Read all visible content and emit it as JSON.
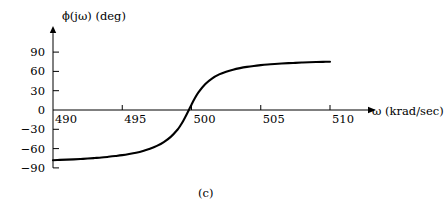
{
  "figure": {
    "caption": "(c)",
    "background_color": "#ffffff",
    "line_color": "#000000"
  },
  "chart_data": {
    "type": "line",
    "title": "",
    "subtitle": "",
    "xlabel": "ω (krad/sec)",
    "ylabel": "ϕ(jω) (deg)",
    "xlim": [
      490,
      510
    ],
    "ylim": [
      -90,
      90
    ],
    "xticks": [
      490,
      495,
      500,
      505,
      510
    ],
    "xtick_labels": [
      "490",
      "495",
      "500",
      "505",
      "510"
    ],
    "yticks": [
      -90,
      -60,
      -30,
      0,
      30,
      60,
      90
    ],
    "ytick_labels": [
      "−90",
      "−60",
      "−30",
      "0",
      "30",
      "60",
      "90"
    ],
    "grid": false,
    "legend": null,
    "annotations": [],
    "series": [
      {
        "name": "phase",
        "x": [
          490.0,
          490.5,
          491.0,
          491.5,
          492.0,
          492.5,
          493.0,
          493.5,
          494.0,
          494.5,
          495.0,
          495.5,
          496.0,
          496.5,
          497.0,
          497.5,
          498.0,
          498.5,
          499.0,
          499.2,
          499.4,
          499.6,
          499.8,
          500.0,
          500.2,
          500.5,
          501.0,
          501.5,
          502.0,
          502.5,
          503.0,
          503.5,
          504.0,
          504.5,
          505.0,
          505.5,
          506.0,
          506.5,
          507.0,
          507.5,
          508.0,
          508.5,
          509.0,
          509.5,
          510.0
        ],
        "y": [
          -78.0,
          -77.6,
          -77.2,
          -76.7,
          -76.1,
          -75.5,
          -74.7,
          -73.9,
          -72.8,
          -71.6,
          -70.2,
          -68.4,
          -66.3,
          -63.6,
          -60.2,
          -55.8,
          -49.9,
          -41.8,
          -30.3,
          -24.1,
          -17.0,
          -9.0,
          -0.4,
          8.3,
          16.7,
          27.5,
          40.5,
          49.3,
          55.3,
          59.5,
          62.7,
          65.1,
          67.0,
          68.5,
          69.7,
          70.7,
          71.5,
          72.2,
          72.8,
          73.3,
          73.8,
          74.2,
          74.5,
          74.8,
          75.1
        ]
      }
    ],
    "zero_crossing_x": 499.81,
    "left_asymptote_y": -78.0,
    "right_asymptote_y": 75.1
  }
}
